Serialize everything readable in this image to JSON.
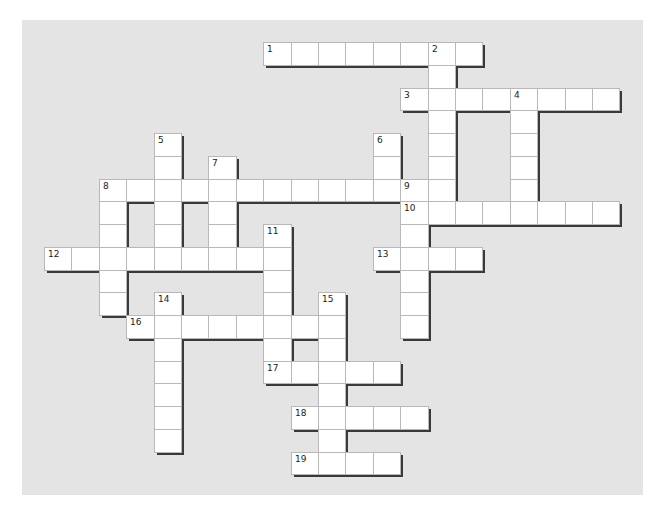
{
  "puzzle": {
    "type": "crossword",
    "grid_geometry": {
      "origin_x": 44,
      "origin_y": 42,
      "cell_w": 27.4,
      "cell_h": 22.75
    },
    "colors": {
      "panel": "#e4e4e4",
      "cell": "#ffffff",
      "cell_border": "#b8b8b8",
      "shadow": "#3a3a3a",
      "number": "#222222"
    },
    "entries": [
      {
        "number": "1",
        "direction": "across",
        "col": 8,
        "row": 0,
        "length": 8
      },
      {
        "number": "2",
        "direction": "down",
        "col": 14,
        "row": 0,
        "length": 7
      },
      {
        "number": "3",
        "direction": "across",
        "col": 13,
        "row": 2,
        "length": 8
      },
      {
        "number": "4",
        "direction": "down",
        "col": 17,
        "row": 2,
        "length": 6
      },
      {
        "number": "5",
        "direction": "down",
        "col": 4,
        "row": 4,
        "length": 6
      },
      {
        "number": "6",
        "direction": "down",
        "col": 12,
        "row": 4,
        "length": 3
      },
      {
        "number": "7",
        "direction": "down",
        "col": 6,
        "row": 5,
        "length": 5
      },
      {
        "number": "8",
        "direction": "across",
        "col": 2,
        "row": 6,
        "length": 13
      },
      {
        "number": "8",
        "direction": "down",
        "col": 2,
        "row": 6,
        "length": 6
      },
      {
        "number": "9",
        "direction": "down",
        "col": 13,
        "row": 6,
        "length": 7
      },
      {
        "number": "10",
        "direction": "across",
        "col": 13,
        "row": 7,
        "length": 8
      },
      {
        "number": "11",
        "direction": "down",
        "col": 8,
        "row": 8,
        "length": 6
      },
      {
        "number": "12",
        "direction": "across",
        "col": 0,
        "row": 9,
        "length": 9
      },
      {
        "number": "13",
        "direction": "across",
        "col": 12,
        "row": 9,
        "length": 4
      },
      {
        "number": "14",
        "direction": "down",
        "col": 4,
        "row": 11,
        "length": 7
      },
      {
        "number": "15",
        "direction": "down",
        "col": 10,
        "row": 11,
        "length": 8
      },
      {
        "number": "16",
        "direction": "across",
        "col": 3,
        "row": 12,
        "length": 8
      },
      {
        "number": "17",
        "direction": "across",
        "col": 8,
        "row": 14,
        "length": 5
      },
      {
        "number": "18",
        "direction": "across",
        "col": 9,
        "row": 16,
        "length": 5
      },
      {
        "number": "19",
        "direction": "across",
        "col": 9,
        "row": 18,
        "length": 4
      }
    ]
  }
}
